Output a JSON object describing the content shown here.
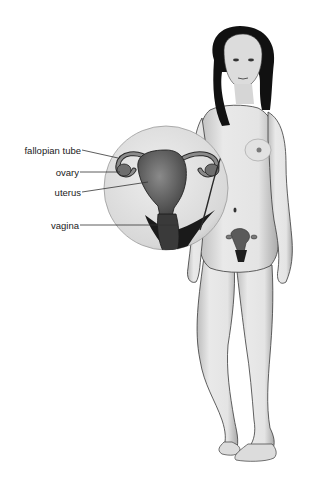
{
  "diagram": {
    "labels": [
      {
        "id": "fallopian-tube",
        "text": "fallopian tube"
      },
      {
        "id": "ovary",
        "text": "ovary"
      },
      {
        "id": "uterus",
        "text": "uterus"
      },
      {
        "id": "vagina",
        "text": "vagina"
      }
    ],
    "colors": {
      "background": "#ffffff",
      "skin": "#e6e6e6",
      "skin_shadow": "#b8b8b8",
      "outline": "#3a3a3a",
      "hair": "#111111",
      "organ": "#6e6e6e",
      "organ_dark": "#2a2a2a",
      "label_text": "#1a1a1a",
      "leader_line": "#333333"
    }
  }
}
